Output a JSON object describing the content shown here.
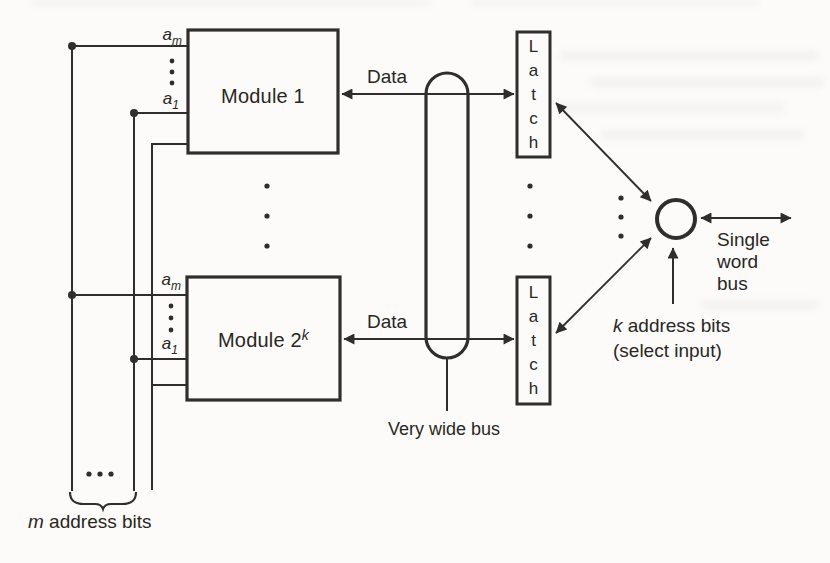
{
  "figure": {
    "modules": [
      {
        "name": "Module 1",
        "sup": ""
      },
      {
        "name": "Module 2",
        "sup": "k"
      }
    ],
    "address_inputs": {
      "base": "a",
      "top_sub": "m",
      "bottom_sub": "1"
    },
    "latch": {
      "word": "Latch",
      "letters": [
        "L",
        "a",
        "t",
        "c",
        "h"
      ]
    },
    "labels": {
      "data": "Data",
      "very_wide_bus": "Very wide bus",
      "single_word_bus": [
        "Single",
        "word",
        "bus"
      ],
      "k_address_line1_var": "k",
      "k_address_line1_rest": " address bits",
      "k_address_line2": "(select input)",
      "m_address_var": "m",
      "m_address_rest": " address bits"
    },
    "colors": {
      "ink": "#2f2e2c",
      "background": "#fcfbf9"
    }
  }
}
